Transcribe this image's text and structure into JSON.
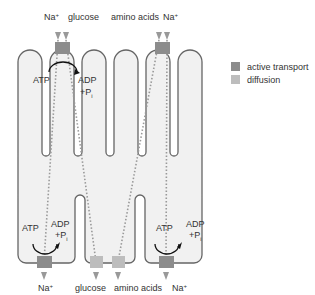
{
  "colors": {
    "active_transport": "#8c8c8c",
    "diffusion": "#bdbdbd",
    "membrane_fill": "#f1f1f1",
    "membrane_stroke": "#666666",
    "path_dots": "#999999"
  },
  "legend": {
    "items": [
      {
        "label": "active transport",
        "color": "#8c8c8c"
      },
      {
        "label": "diffusion",
        "color": "#bdbdbd"
      }
    ]
  },
  "labels": {
    "top_na_left": "Na",
    "top_glucose": "glucose",
    "top_amino_acids": "amino acids",
    "top_na_right": "Na",
    "bottom_na_left": "Na",
    "bottom_glucose": "glucose",
    "bottom_amino_acids": "amino acids",
    "bottom_na_right": "Na",
    "na_superscript": "+",
    "atp": "ATP",
    "adp": "ADP",
    "pi_prefix": "+P",
    "pi_subscript": "i"
  }
}
